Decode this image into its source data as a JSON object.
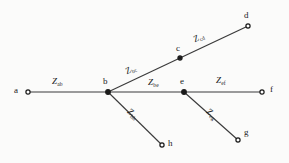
{
  "diagram": {
    "type": "impedance-network-tree",
    "width": 289,
    "height": 163,
    "background_color": "#fbfbfa",
    "line_color": "#3a3a3a",
    "node_color": "#1a1a1a",
    "nodes": [
      {
        "id": "a",
        "label": "a",
        "x": 28,
        "y": 92,
        "label_x": 14,
        "label_y": 86
      },
      {
        "id": "b",
        "label": "b",
        "x": 108,
        "y": 92,
        "label_x": 103,
        "label_y": 77
      },
      {
        "id": "c",
        "label": "c",
        "x": 180,
        "y": 58,
        "label_x": 176,
        "label_y": 44
      },
      {
        "id": "d",
        "label": "d",
        "x": 248,
        "y": 26,
        "label_x": 244,
        "label_y": 11
      },
      {
        "id": "e",
        "label": "e",
        "x": 184,
        "y": 92,
        "label_x": 180,
        "label_y": 77
      },
      {
        "id": "f",
        "label": "f",
        "x": 262,
        "y": 92,
        "label_x": 270,
        "label_y": 85
      },
      {
        "id": "g",
        "label": "g",
        "x": 238,
        "y": 140,
        "label_x": 244,
        "label_y": 128
      },
      {
        "id": "h",
        "label": "h",
        "x": 162,
        "y": 145,
        "label_x": 168,
        "label_y": 139
      }
    ],
    "edges": [
      {
        "id": "ab",
        "from": "a",
        "to": "b",
        "symbol": "Z",
        "subscript": "ab",
        "label_x": 52,
        "label_y": 77,
        "rotation_class": ""
      },
      {
        "id": "bc",
        "from": "b",
        "to": "c",
        "symbol": "Z",
        "subscript": "bc",
        "label_x": 128,
        "label_y": 67,
        "rotation_class": "rot-bc"
      },
      {
        "id": "cd",
        "from": "c",
        "to": "d",
        "symbol": "Z",
        "subscript": "cd",
        "label_x": 196,
        "label_y": 35,
        "rotation_class": "rot-cd"
      },
      {
        "id": "be",
        "from": "b",
        "to": "e",
        "symbol": "Z",
        "subscript": "be",
        "label_x": 148,
        "label_y": 78,
        "rotation_class": ""
      },
      {
        "id": "ef",
        "from": "e",
        "to": "f",
        "symbol": "Z",
        "subscript": "ef",
        "label_x": 216,
        "label_y": 76,
        "rotation_class": ""
      },
      {
        "id": "bh",
        "from": "b",
        "to": "h",
        "symbol": "Z",
        "subscript": "bh",
        "label_x": 131,
        "label_y": 107,
        "rotation_class": "rot-bh"
      },
      {
        "id": "eg",
        "from": "e",
        "to": "g",
        "symbol": "Z",
        "subscript": "eg",
        "label_x": 210,
        "label_y": 107,
        "rotation_class": "rot-eg"
      }
    ]
  }
}
